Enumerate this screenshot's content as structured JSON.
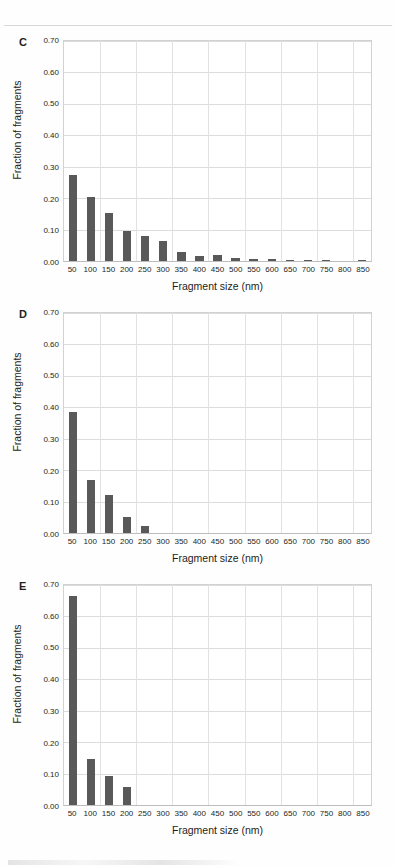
{
  "figure": {
    "axis_titles": {
      "y": "Fraction of fragments",
      "x": "Fragment size (nm)"
    },
    "bar_color": "#595959",
    "grid_color": "#dcdcdc",
    "plot_border_color": "#d2d2d2",
    "background": "#ffffff"
  },
  "panels": [
    {
      "letter": "C",
      "chart_data": {
        "type": "bar",
        "title": "C",
        "xlabel": "Fragment size (nm)",
        "ylabel": "Fraction of fragments",
        "ylim": [
          0.0,
          0.7
        ],
        "ytick_labels": [
          "0.00",
          "0.10",
          "0.20",
          "0.30",
          "0.40",
          "0.50",
          "0.60",
          "0.70"
        ],
        "ytick_values": [
          0.0,
          0.1,
          0.2,
          0.3,
          0.4,
          0.5,
          0.6,
          0.7
        ],
        "grid": true,
        "legend": "none",
        "categories": [
          "50",
          "100",
          "150",
          "200",
          "250",
          "300",
          "350",
          "400",
          "450",
          "500",
          "550",
          "600",
          "650",
          "700",
          "750",
          "800",
          "850"
        ],
        "values": [
          0.275,
          0.205,
          0.152,
          0.095,
          0.08,
          0.065,
          0.028,
          0.016,
          0.018,
          0.011,
          0.008,
          0.006,
          0.002,
          0.002,
          0.001,
          0.0,
          0.002
        ]
      }
    },
    {
      "letter": "D",
      "chart_data": {
        "type": "bar",
        "title": "D",
        "xlabel": "Fragment size (nm)",
        "ylabel": "Fraction of fragments",
        "ylim": [
          0.0,
          0.7
        ],
        "ytick_labels": [
          "0.00",
          "0.10",
          "0.20",
          "0.30",
          "0.40",
          "0.50",
          "0.60",
          "0.70"
        ],
        "ytick_values": [
          0.0,
          0.1,
          0.2,
          0.3,
          0.4,
          0.5,
          0.6,
          0.7
        ],
        "grid": true,
        "legend": "none",
        "categories": [
          "50",
          "100",
          "150",
          "200",
          "250",
          "300",
          "350",
          "400",
          "450",
          "500",
          "550",
          "600",
          "650",
          "700",
          "750",
          "800",
          "850"
        ],
        "values": [
          0.385,
          0.168,
          0.12,
          0.052,
          0.022,
          0.0,
          0.0,
          0.0,
          0.0,
          0.0,
          0.0,
          0.0,
          0.0,
          0.0,
          0.0,
          0.0,
          0.0
        ]
      }
    },
    {
      "letter": "E",
      "chart_data": {
        "type": "bar",
        "title": "E",
        "xlabel": "Fragment size (nm)",
        "ylabel": "Fraction of fragments",
        "ylim": [
          0.0,
          0.7
        ],
        "ytick_labels": [
          "0.00",
          "0.10",
          "0.20",
          "0.30",
          "0.40",
          "0.50",
          "0.60",
          "0.70"
        ],
        "ytick_values": [
          0.0,
          0.1,
          0.2,
          0.3,
          0.4,
          0.5,
          0.6,
          0.7
        ],
        "grid": true,
        "legend": "none",
        "categories": [
          "50",
          "100",
          "150",
          "200",
          "250",
          "300",
          "350",
          "400",
          "450",
          "500",
          "550",
          "600",
          "650",
          "700",
          "750",
          "800",
          "850"
        ],
        "values": [
          0.665,
          0.148,
          0.092,
          0.058,
          0.0,
          0.0,
          0.0,
          0.0,
          0.0,
          0.0,
          0.0,
          0.0,
          0.0,
          0.0,
          0.0,
          0.0,
          0.0
        ]
      }
    }
  ]
}
